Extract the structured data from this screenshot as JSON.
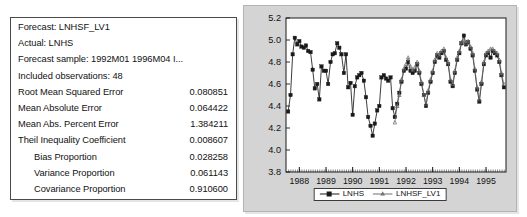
{
  "stats": {
    "rows": [
      {
        "label": "Forecast: LNHSF_LV1",
        "value": ""
      },
      {
        "label": "Actual: LNHS",
        "value": ""
      },
      {
        "label": "Forecast sample: 1992M01 1996M04 I...",
        "value": ""
      },
      {
        "label": "Included observations: 48",
        "value": ""
      },
      {
        "label": "Root Mean Squared Error",
        "value": "0.080851"
      },
      {
        "label": "Mean Absolute Error",
        "value": "0.064422"
      },
      {
        "label": "Mean Abs. Percent Error",
        "value": "1.384211"
      },
      {
        "label": "Theil Inequality Coefficient",
        "value": "0.008607"
      },
      {
        "label": "Bias Proportion",
        "value": "0.028258",
        "indent": true
      },
      {
        "label": "Variance Proportion",
        "value": "0.061143",
        "indent": true
      },
      {
        "label": "Covariance Proportion",
        "value": "0.910600",
        "indent": true
      }
    ]
  },
  "legend": {
    "actual_label": "LNHS",
    "forecast_label": "LNHSF_LV1"
  },
  "chart_data": {
    "type": "line",
    "title": "",
    "xlabel": "",
    "ylabel": "",
    "ylim": [
      3.8,
      5.2
    ],
    "yticks": [
      "3.8",
      "4.0",
      "4.2",
      "4.4",
      "4.6",
      "4.8",
      "5.0",
      "5.2"
    ],
    "ytick_values": [
      3.8,
      4.0,
      4.2,
      4.4,
      4.6,
      4.8,
      5.0,
      5.2
    ],
    "xticks": [
      "1988",
      "1989",
      "1990",
      "1991",
      "1992",
      "1993",
      "1994",
      "1995"
    ],
    "xtick_values": [
      1988,
      1989,
      1990,
      1991,
      1992,
      1993,
      1994,
      1995
    ],
    "xlim": [
      1987.5,
      1995.75
    ],
    "grid": false,
    "legend_position": "bottom-center",
    "series": [
      {
        "name": "LNHS",
        "marker": "filled-square",
        "color": "#1a1a1a",
        "x": [
          1987.58,
          1987.67,
          1987.75,
          1987.83,
          1987.92,
          1988.0,
          1988.08,
          1988.17,
          1988.25,
          1988.33,
          1988.42,
          1988.5,
          1988.58,
          1988.67,
          1988.75,
          1988.83,
          1988.92,
          1989.0,
          1989.08,
          1989.17,
          1989.25,
          1989.33,
          1989.42,
          1989.5,
          1989.58,
          1989.67,
          1989.75,
          1989.83,
          1989.92,
          1990.0,
          1990.08,
          1990.17,
          1990.25,
          1990.33,
          1990.42,
          1990.5,
          1990.58,
          1990.67,
          1990.75,
          1990.83,
          1990.92,
          1991.0,
          1991.08,
          1991.17,
          1991.25,
          1991.33,
          1991.42,
          1991.5,
          1991.58,
          1991.67,
          1991.75,
          1991.83,
          1991.92,
          1992.0,
          1992.08,
          1992.17,
          1992.25,
          1992.33,
          1992.42,
          1992.5,
          1992.58,
          1992.67,
          1992.75,
          1992.83,
          1992.92,
          1993.0,
          1993.08,
          1993.17,
          1993.25,
          1993.33,
          1993.42,
          1993.5,
          1993.58,
          1993.67,
          1993.75,
          1993.83,
          1993.92,
          1994.0,
          1994.08,
          1994.17,
          1994.25,
          1994.33,
          1994.42,
          1994.5,
          1994.58,
          1994.67,
          1994.75,
          1994.83,
          1994.92,
          1995.0,
          1995.08,
          1995.17,
          1995.25,
          1995.33,
          1995.42,
          1995.5,
          1995.58,
          1995.67
        ],
        "y": [
          4.35,
          4.5,
          4.87,
          5.02,
          4.96,
          4.99,
          4.94,
          4.93,
          4.95,
          4.9,
          4.89,
          4.73,
          4.56,
          4.6,
          4.46,
          4.76,
          4.72,
          4.72,
          4.6,
          4.8,
          4.87,
          4.88,
          4.97,
          4.93,
          4.87,
          4.7,
          4.87,
          4.57,
          4.61,
          4.32,
          4.58,
          4.66,
          4.68,
          4.7,
          4.63,
          4.48,
          4.3,
          4.22,
          4.13,
          4.24,
          4.36,
          4.4,
          4.66,
          4.68,
          4.65,
          4.63,
          4.66,
          4.38,
          4.3,
          4.42,
          4.52,
          4.62,
          4.72,
          4.74,
          4.8,
          4.72,
          4.7,
          4.72,
          4.78,
          4.7,
          4.6,
          4.5,
          4.4,
          4.52,
          4.62,
          4.7,
          4.8,
          4.86,
          4.84,
          4.88,
          4.9,
          4.82,
          4.78,
          4.62,
          4.58,
          4.7,
          4.82,
          4.88,
          4.97,
          5.04,
          4.96,
          4.98,
          4.92,
          4.86,
          4.72,
          4.55,
          4.44,
          4.6,
          4.78,
          4.86,
          4.88,
          4.84,
          4.9,
          4.88,
          4.86,
          4.8,
          4.68,
          4.57
        ]
      },
      {
        "name": "LNHSF_LV1",
        "marker": "small-triangle",
        "color": "#6a6a6a",
        "x": [
          1991.58,
          1991.67,
          1991.75,
          1991.83,
          1991.92,
          1992.0,
          1992.08,
          1992.17,
          1992.25,
          1992.33,
          1992.42,
          1992.5,
          1992.58,
          1992.67,
          1992.75,
          1992.83,
          1992.92,
          1993.0,
          1993.08,
          1993.17,
          1993.25,
          1993.33,
          1993.42,
          1993.5,
          1993.58,
          1993.67,
          1993.75,
          1993.83,
          1993.92,
          1994.0,
          1994.08,
          1994.17,
          1994.25,
          1994.33,
          1994.42,
          1994.5,
          1994.58,
          1994.67,
          1994.75,
          1994.83,
          1994.92,
          1995.0,
          1995.08,
          1995.17,
          1995.25,
          1995.33,
          1995.42,
          1995.5,
          1995.58,
          1995.67
        ],
        "y": [
          4.25,
          4.4,
          4.5,
          4.64,
          4.74,
          4.78,
          4.84,
          4.76,
          4.73,
          4.75,
          4.8,
          4.72,
          4.62,
          4.5,
          4.42,
          4.54,
          4.64,
          4.72,
          4.82,
          4.88,
          4.86,
          4.9,
          4.92,
          4.84,
          4.8,
          4.64,
          4.6,
          4.72,
          4.84,
          4.9,
          4.98,
          5.0,
          4.97,
          4.99,
          4.94,
          4.88,
          4.74,
          4.57,
          4.46,
          4.62,
          4.8,
          4.88,
          4.9,
          4.92,
          4.92,
          4.9,
          4.88,
          4.82,
          4.7,
          4.6
        ]
      }
    ]
  }
}
